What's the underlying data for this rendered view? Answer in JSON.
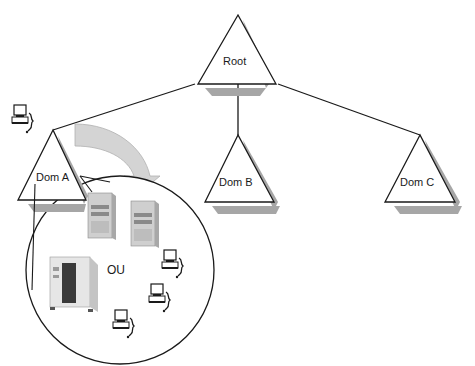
{
  "diagram": {
    "type": "active-directory-hierarchy",
    "nodes": {
      "root": {
        "label": "Root"
      },
      "dom_a": {
        "label": "Dom A"
      },
      "dom_b": {
        "label": "Dom B"
      },
      "dom_c": {
        "label": "Dom C"
      },
      "ou": {
        "label": "OU"
      }
    },
    "edges": [
      {
        "from": "Root",
        "to": "Dom A"
      },
      {
        "from": "Root",
        "to": "Dom B"
      },
      {
        "from": "Root",
        "to": "Dom C"
      }
    ],
    "zoom_callout": {
      "from": "Dom A",
      "to": "OU",
      "arrow": "curved-gray-arrow"
    },
    "ou_contents": {
      "servers": [
        "tower-server",
        "tower-server",
        "rack-server"
      ],
      "workstations": 3
    },
    "domain_workstations": 1,
    "colors": {
      "line": "#1a1a1a",
      "shadow": "#a6a6a6",
      "arrow_fill": "#d4d4d4",
      "arrow_stroke": "#b0b0b0",
      "background": "#ffffff"
    }
  }
}
